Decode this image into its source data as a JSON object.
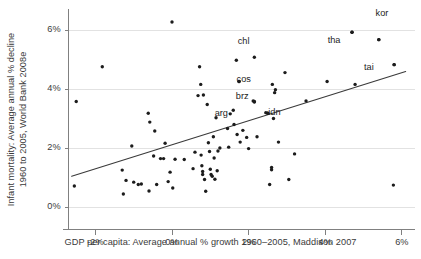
{
  "chart_data": {
    "type": "scatter",
    "title": "",
    "xlabel": "GDP per capita: Average annual % growth 1960–2005, Maddison 2007",
    "ylabel": "Infant mortality: Average annual % decline\n1960 to 2005, World Bank 2008e",
    "ylabel_line1": "Infant mortality: Average annual % decline",
    "ylabel_line2": "1960 to 2005, World Bank 2008e",
    "xlim": [
      -2.7,
      6.2
    ],
    "ylim": [
      -0.35,
      6.6
    ],
    "xticks": [
      -2,
      0,
      2,
      4,
      6
    ],
    "xticklabels": [
      "-2%",
      "0%",
      "2%",
      "4%",
      "6%"
    ],
    "yticks": [
      0,
      2,
      4,
      6
    ],
    "yticklabels": [
      "0%",
      "2%",
      "4%",
      "6%"
    ],
    "grid": "horizontal",
    "grid_color": "#e2e2e2",
    "axis_color": "#808080",
    "point_color": "#1c1c1c",
    "point_size": 1.7,
    "legend": "none",
    "trendline": {
      "name": "linear fit",
      "color": "#3a3a3a",
      "width": 1.1,
      "x0": -2.62,
      "y0": 1.06,
      "x1": 6.1,
      "y1": 4.62
    },
    "annotations": [
      {
        "label": "kor",
        "x": 5.55,
        "y": 6.55,
        "point_x": 4.7,
        "point_y": 5.95
      },
      {
        "label": "chl",
        "x": 1.95,
        "y": 5.6,
        "point_x": 2.15,
        "point_y": 5.1
      },
      {
        "label": "tha",
        "x": 4.3,
        "y": 5.62,
        "point_x": 5.4,
        "point_y": 5.7
      },
      {
        "label": "tai",
        "x": 5.25,
        "y": 4.72,
        "point_x": 5.8,
        "point_y": 4.85
      },
      {
        "label": "cos",
        "x": 1.92,
        "y": 4.3,
        "point_x": 1.75,
        "point_y": 4.28
      },
      {
        "label": "brz",
        "x": 1.9,
        "y": 3.72,
        "point_x": 2.15,
        "point_y": 3.6
      },
      {
        "label": "arg",
        "x": 1.35,
        "y": 3.16,
        "point_x": 1.15,
        "point_y": 3.05
      },
      {
        "label": "idn",
        "x": 2.75,
        "y": 3.2,
        "point_x": 2.5,
        "point_y": 3.2
      }
    ],
    "points": [
      [
        -2.55,
        0.73
      ],
      [
        -2.5,
        3.6
      ],
      [
        -1.82,
        4.78
      ],
      [
        -1.3,
        1.27
      ],
      [
        -1.27,
        0.46
      ],
      [
        -1.2,
        0.92
      ],
      [
        -1.05,
        2.09
      ],
      [
        -1.0,
        0.86
      ],
      [
        -0.88,
        0.78
      ],
      [
        -0.8,
        0.8
      ],
      [
        -0.62,
        3.2
      ],
      [
        -0.6,
        0.56
      ],
      [
        -0.58,
        2.9
      ],
      [
        -0.48,
        1.75
      ],
      [
        -0.45,
        2.6
      ],
      [
        -0.4,
        0.78
      ],
      [
        -0.3,
        1.66
      ],
      [
        -0.22,
        1.66
      ],
      [
        -0.18,
        2.18
      ],
      [
        -0.1,
        0.88
      ],
      [
        -0.05,
        1.2
      ],
      [
        0.0,
        6.3
      ],
      [
        0.02,
        0.66
      ],
      [
        0.08,
        1.64
      ],
      [
        0.32,
        1.63
      ],
      [
        0.55,
        1.32
      ],
      [
        0.6,
        1.88
      ],
      [
        0.68,
        3.8
      ],
      [
        0.72,
        4.78
      ],
      [
        0.75,
        4.18
      ],
      [
        0.76,
        1.78
      ],
      [
        0.78,
        1.42
      ],
      [
        0.8,
        1.22
      ],
      [
        0.8,
        1.12
      ],
      [
        0.82,
        3.82
      ],
      [
        0.85,
        0.95
      ],
      [
        0.88,
        0.55
      ],
      [
        0.92,
        3.5
      ],
      [
        0.95,
        2.2
      ],
      [
        0.98,
        1.9
      ],
      [
        1.0,
        1.3
      ],
      [
        1.02,
        1.12
      ],
      [
        1.05,
        1.06
      ],
      [
        1.08,
        2.4
      ],
      [
        1.1,
        1.68
      ],
      [
        1.12,
        0.96
      ],
      [
        1.18,
        1.25
      ],
      [
        1.2,
        1.92
      ],
      [
        1.25,
        2.02
      ],
      [
        1.45,
        2.68
      ],
      [
        1.48,
        2.05
      ],
      [
        1.52,
        3.18
      ],
      [
        1.6,
        3.3
      ],
      [
        1.62,
        2.82
      ],
      [
        1.68,
        5.0
      ],
      [
        1.7,
        2.48
      ],
      [
        1.75,
        4.28
      ],
      [
        1.78,
        2.22
      ],
      [
        1.85,
        2.62
      ],
      [
        1.95,
        2.38
      ],
      [
        2.0,
        2.0
      ],
      [
        2.12,
        3.62
      ],
      [
        2.15,
        3.58
      ],
      [
        2.22,
        2.4
      ],
      [
        2.45,
        3.22
      ],
      [
        2.5,
        3.2
      ],
      [
        2.55,
        0.78
      ],
      [
        2.6,
        1.36
      ],
      [
        2.6,
        1.28
      ],
      [
        2.62,
        4.18
      ],
      [
        2.65,
        3.02
      ],
      [
        2.68,
        3.9
      ],
      [
        2.7,
        4.0
      ],
      [
        2.78,
        2.22
      ],
      [
        2.95,
        4.58
      ],
      [
        3.05,
        0.95
      ],
      [
        3.2,
        1.82
      ],
      [
        3.5,
        3.62
      ],
      [
        4.05,
        4.28
      ],
      [
        4.7,
        5.95
      ],
      [
        4.78,
        4.18
      ],
      [
        5.4,
        5.7
      ],
      [
        5.78,
        0.76
      ],
      [
        5.8,
        4.85
      ]
    ]
  }
}
